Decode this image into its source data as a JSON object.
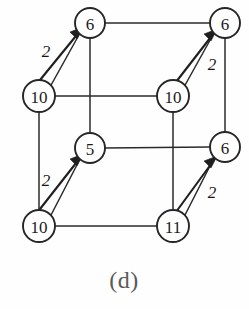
{
  "figure": {
    "caption": "(d)",
    "type": "cube-graph",
    "width": 249,
    "height": 309,
    "stroke_color": "#2b2b2b",
    "node_fill": "#ffffff",
    "caption_color": "#5a5a5a"
  },
  "nodes": [
    {
      "id": "top-back-left",
      "label": "6",
      "cx": 90,
      "cy": 23,
      "r": 15
    },
    {
      "id": "top-back-right",
      "label": "6",
      "cx": 225,
      "cy": 23,
      "r": 15
    },
    {
      "id": "top-front-left",
      "label": "10",
      "cx": 39,
      "cy": 96,
      "r": 16
    },
    {
      "id": "top-front-right",
      "label": "10",
      "cx": 173,
      "cy": 96,
      "r": 16
    },
    {
      "id": "bot-back-left",
      "label": "5",
      "cx": 90,
      "cy": 148,
      "r": 15
    },
    {
      "id": "bot-back-right",
      "label": "6",
      "cx": 225,
      "cy": 147,
      "r": 15
    },
    {
      "id": "bot-front-left",
      "label": "10",
      "cx": 39,
      "cy": 226,
      "r": 16
    },
    {
      "id": "bot-front-right",
      "label": "11",
      "cx": 173,
      "cy": 226,
      "r": 16
    }
  ],
  "edges": [
    {
      "id": "top-back-horizontal",
      "from": "top-back-left",
      "to": "top-back-right",
      "x1": 105,
      "y1": 23,
      "x2": 210,
      "y2": 23
    },
    {
      "id": "top-front-horizontal",
      "from": "top-front-left",
      "to": "top-front-right",
      "x1": 55,
      "y1": 96,
      "x2": 157,
      "y2": 96
    },
    {
      "id": "bot-back-horizontal",
      "from": "bot-back-left",
      "to": "bot-back-right",
      "x1": 105,
      "y1": 148,
      "x2": 210,
      "y2": 147
    },
    {
      "id": "bot-front-horizontal",
      "from": "bot-front-left",
      "to": "bot-front-right",
      "x1": 55,
      "y1": 226,
      "x2": 157,
      "y2": 226
    },
    {
      "id": "left-back-vertical",
      "from": "top-back-left",
      "to": "bot-back-left",
      "x1": 90,
      "y1": 38,
      "x2": 90,
      "y2": 133
    },
    {
      "id": "right-back-vertical",
      "from": "top-back-right",
      "to": "bot-back-right",
      "x1": 225,
      "y1": 38,
      "x2": 225,
      "y2": 132
    },
    {
      "id": "left-front-vertical",
      "from": "top-front-left",
      "to": "bot-front-left",
      "x1": 39,
      "y1": 112,
      "x2": 39,
      "y2": 210
    },
    {
      "id": "right-front-vertical",
      "from": "top-front-right",
      "to": "bot-front-right",
      "x1": 173,
      "y1": 112,
      "x2": 173,
      "y2": 210
    }
  ],
  "arrows": [
    {
      "id": "arrow-top-left",
      "from": "top-front-left",
      "to": "top-back-left",
      "weight": "2",
      "x1": 50,
      "y1": 85,
      "x2": 80,
      "y2": 34,
      "label_x": 54,
      "label_y": 50
    },
    {
      "id": "arrow-top-right",
      "from": "top-front-right",
      "to": "top-back-right",
      "weight": "2",
      "x1": 185,
      "y1": 85,
      "x2": 215,
      "y2": 34,
      "label_x": 212,
      "label_y": 62
    },
    {
      "id": "arrow-bottom-left",
      "from": "bot-front-left",
      "to": "bot-back-left",
      "weight": "2",
      "x1": 50,
      "y1": 215,
      "x2": 80,
      "y2": 160,
      "label_x": 54,
      "label_y": 180
    },
    {
      "id": "arrow-bottom-right",
      "from": "bot-front-right",
      "to": "bot-back-right",
      "weight": "2",
      "x1": 185,
      "y1": 215,
      "x2": 215,
      "y2": 160,
      "label_x": 212,
      "label_y": 190
    }
  ],
  "caption": {
    "text": "(d)",
    "x": 124,
    "y": 280
  }
}
